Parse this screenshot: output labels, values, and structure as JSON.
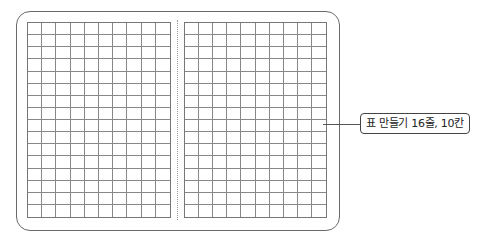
{
  "diagram": {
    "type": "grid-table-illustration",
    "callout": {
      "label": "표 만들기 16줄, 10칸"
    },
    "grids": [
      {
        "name": "left-grid",
        "rows": 16,
        "cols": 10
      },
      {
        "name": "right-grid",
        "rows": 16,
        "cols": 10
      }
    ],
    "colors": {
      "line": "#888888",
      "frame": "#6a6a6a",
      "background": "#ffffff"
    }
  }
}
